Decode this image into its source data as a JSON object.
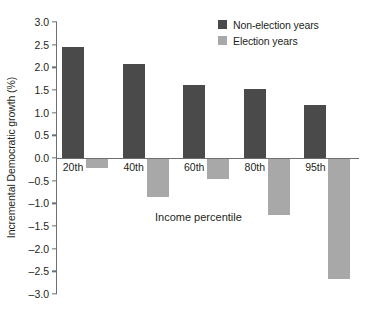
{
  "chart_data": {
    "type": "bar",
    "title": "",
    "xlabel": "Income percentile",
    "ylabel": "Incremental Democratic growth (%)",
    "categories": [
      "20th",
      "40th",
      "60th",
      "80th",
      "95th"
    ],
    "series": [
      {
        "name": "Non-election years",
        "color": "#4a4a4a",
        "values": [
          2.45,
          2.08,
          1.6,
          1.52,
          1.16
        ]
      },
      {
        "name": "Election years",
        "color": "#a8a8a8",
        "values": [
          -0.23,
          -0.85,
          -0.46,
          -1.25,
          -2.68
        ]
      }
    ],
    "ylim": [
      -3.0,
      3.0
    ],
    "yticks": [
      3.0,
      2.5,
      2.0,
      1.5,
      1.0,
      0.5,
      0.0,
      -0.5,
      -1.0,
      -1.5,
      -2.0,
      -2.5,
      -3.0
    ],
    "ytick_labels": [
      "3.0",
      "2.5",
      "2.0",
      "1.5",
      "1.0",
      "0.5",
      "0.0",
      "–0.5",
      "–1.0",
      "–1.5",
      "–2.0",
      "–2.5",
      "–3.0"
    ],
    "grid": false,
    "legend_position": "top-right"
  },
  "legend": {
    "items": [
      {
        "label": "Non-election years",
        "color": "#4a4a4a"
      },
      {
        "label": "Election years",
        "color": "#a8a8a8"
      }
    ]
  },
  "axes": {
    "axis_color": "#6d6e71",
    "text_color": "#231f20"
  }
}
